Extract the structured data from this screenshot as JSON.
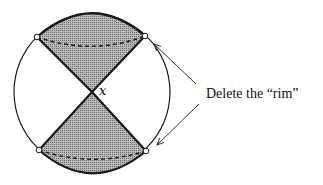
{
  "diagram": {
    "point_label": "x",
    "caption": "Delete the “rim”",
    "colors": {
      "stroke": "#1a1a1a",
      "fill": "#9a9a9a",
      "background": "#ffffff",
      "arrow": "#333333"
    },
    "elements": [
      "outer-circle",
      "upper-shaded-cone",
      "lower-shaded-cone",
      "upper-dashed-arc",
      "lower-dashed-arc",
      "four-rim-points",
      "two-arrows-to-rim"
    ]
  }
}
